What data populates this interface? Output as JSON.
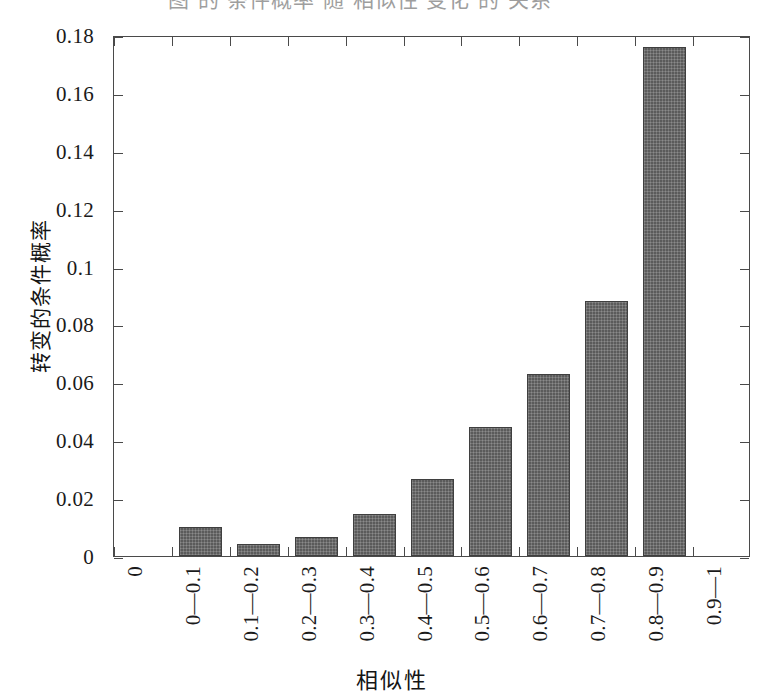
{
  "top_caption_fragment": "图 的 条件概率 随 相似性 变化 的 关系",
  "chart_data": {
    "type": "bar",
    "title": "",
    "xlabel": "相似性",
    "ylabel": "转变的条件概率",
    "categories": [
      "0—0.1",
      "0.1—0.2",
      "0.2—0.3",
      "0.3—0.4",
      "0.4—0.5",
      "0.5—0.6",
      "0.6—0.7",
      "0.7—0.8",
      "0.8—0.9",
      "0.9—1"
    ],
    "values": [
      0.01,
      0.004,
      0.0065,
      0.0145,
      0.0265,
      0.0445,
      0.063,
      0.088,
      0.176,
      0.0
    ],
    "ylim": [
      0,
      0.18
    ],
    "ytick_labels": [
      "0",
      "0.02",
      "0.04",
      "0.06",
      "0.08",
      "0.1",
      "0.12",
      "0.14",
      "0.16",
      "0.18"
    ],
    "ytick_values": [
      0,
      0.02,
      0.04,
      0.06,
      0.08,
      0.1,
      0.12,
      0.14,
      0.16,
      0.18
    ],
    "xtick_labels": [
      "0",
      "0—0.1",
      "0.1—0.2",
      "0.2—0.3",
      "0.3—0.4",
      "0.4—0.5",
      "0.5—0.6",
      "0.6—0.7",
      "0.7—0.8",
      "0.8—0.9",
      "0.9—1"
    ],
    "grid": false,
    "legend": null,
    "bar_color": "#5b5b5b",
    "axis_color": "#4a4a4a",
    "background": "#ffffff"
  }
}
